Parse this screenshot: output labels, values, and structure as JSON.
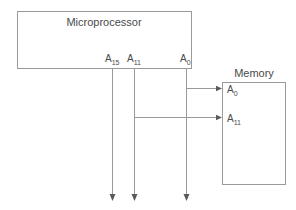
{
  "diagram": {
    "type": "block-diagram",
    "background_color": "#ffffff",
    "line_color": "#9a9a9a",
    "text_color": "#4a4a4a",
    "arrow_color": "#5a5a5a"
  },
  "microprocessor": {
    "title": "Microprocessor",
    "box": {
      "x": 17,
      "y": 11,
      "width": 174,
      "height": 57
    },
    "title_position": {
      "x": 104,
      "y": 26
    },
    "pins": [
      {
        "id": "a15",
        "base": "A",
        "subscript": "15",
        "label": "A15",
        "x": 112,
        "label_x": 105,
        "label_y": 62
      },
      {
        "id": "a11",
        "base": "A",
        "subscript": "11",
        "label": "A11",
        "x": 134,
        "label_x": 127,
        "label_y": 62
      },
      {
        "id": "a0",
        "base": "A",
        "subscript": "0",
        "label": "A0",
        "x": 186,
        "label_x": 180,
        "label_y": 62
      }
    ]
  },
  "memory": {
    "title": "Memory",
    "box": {
      "x": 222,
      "y": 82,
      "width": 63,
      "height": 103
    },
    "title_position": {
      "x": 254,
      "y": 77
    },
    "pins": [
      {
        "id": "mem_a0",
        "base": "A",
        "subscript": "0",
        "label": "A0",
        "y": 89,
        "label_x": 227,
        "label_y": 93
      },
      {
        "id": "mem_a11",
        "base": "A",
        "subscript": "11",
        "label": "A11",
        "y": 118,
        "label_x": 227,
        "label_y": 122
      }
    ]
  },
  "wires": [
    {
      "id": "bus-a15",
      "from_pin": "a15",
      "x": 112,
      "y1": 68,
      "y2": 198,
      "arrow": "down"
    },
    {
      "id": "bus-a11",
      "from_pin": "a11",
      "x": 134,
      "y1": 68,
      "y2": 198,
      "arrow": "down"
    },
    {
      "id": "bus-a0",
      "from_pin": "a0",
      "x": 186,
      "y1": 68,
      "y2": 198,
      "arrow": "down"
    },
    {
      "id": "link-a0-to-memory",
      "x1": 186,
      "x2": 222,
      "y": 89,
      "arrow": "right"
    },
    {
      "id": "link-a11-to-memory",
      "x1": 134,
      "x2": 222,
      "y": 118,
      "arrow": "right"
    }
  ]
}
